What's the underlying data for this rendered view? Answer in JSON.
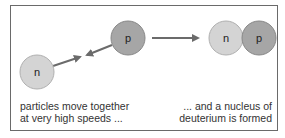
{
  "diagram": {
    "left_scene": {
      "neutron_label": "n",
      "proton_label": "p",
      "caption_line1": "particles move together",
      "caption_line2": "at very high speeds ..."
    },
    "right_scene": {
      "neutron_label": "n",
      "proton_label": "p",
      "caption_line1": "... and a nucleus of",
      "caption_line2": "deuterium is formed"
    },
    "colors": {
      "neutron": "#d4d4d4",
      "proton": "#a6a6a6",
      "arrow": "#6b6b6b",
      "border": "#6a6a6a"
    }
  }
}
